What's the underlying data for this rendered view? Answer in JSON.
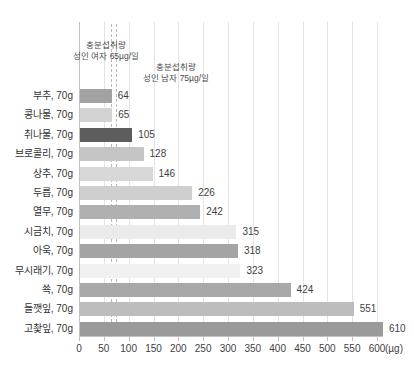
{
  "chart_data": {
    "type": "bar",
    "orientation": "horizontal",
    "title": "",
    "xlabel": "",
    "ylabel": "",
    "xunit": "(µg)",
    "xlim": [
      0,
      600
    ],
    "x_ticks": [
      0,
      50,
      100,
      150,
      200,
      250,
      300,
      350,
      400,
      450,
      500,
      550,
      600
    ],
    "grid": true,
    "categories": [
      "부추, 70g",
      "콩나물, 70g",
      "취나물, 70g",
      "브로콜리, 70g",
      "상추, 70g",
      "두릅, 70g",
      "열무, 70g",
      "시금치, 70g",
      "아욱, 70g",
      "무시래기, 70g",
      "쑉, 70g",
      "들깻잎, 70g",
      "고촻잎, 70g"
    ],
    "values": [
      64,
      65,
      105,
      128,
      146,
      226,
      242,
      315,
      318,
      323,
      424,
      551,
      610
    ],
    "bar_colors": [
      "#a2a2a2",
      "#d2d2d2",
      "#5d5d5d",
      "#c5c5c5",
      "#d7d7d7",
      "#cfcfcf",
      "#b0b0b0",
      "#ebebeb",
      "#a4a4a4",
      "#f0f0f0",
      "#a8a8a8",
      "#bdbdbd",
      "#9a9a9a"
    ],
    "bar_striped": [
      true,
      true,
      false,
      false,
      true,
      false,
      true,
      false,
      true,
      false,
      false,
      true,
      false
    ],
    "reference_lines": [
      {
        "value": 65,
        "label_line1": "충분섭취량",
        "label_line2": "성인 여자 65µg/일"
      },
      {
        "value": 75,
        "label_line1": "충분섭취량",
        "label_line2": "성인 남자 75µg/일"
      }
    ],
    "colors": {
      "gridline": "#e4e4e4",
      "axis": "#c2c2c2",
      "refline": "#b9b9b9",
      "text": "#3f3f3f"
    }
  }
}
